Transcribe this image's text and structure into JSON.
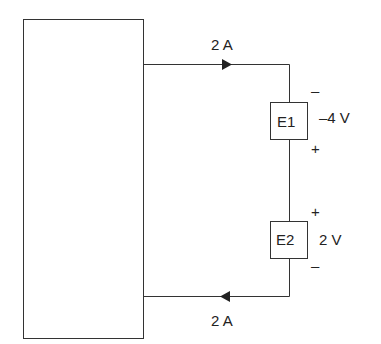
{
  "diagram": {
    "type": "circuit",
    "network_box": {
      "label": ""
    },
    "currents": {
      "top": "2 A",
      "bottom": "2 A"
    },
    "elements": [
      {
        "name": "E1",
        "voltage": "–4 V",
        "top_polarity": "–",
        "bottom_polarity": "+"
      },
      {
        "name": "E2",
        "voltage": "2 V",
        "top_polarity": "+",
        "bottom_polarity": "–"
      }
    ],
    "colors": {
      "line": "#333333",
      "background": "#ffffff"
    }
  }
}
